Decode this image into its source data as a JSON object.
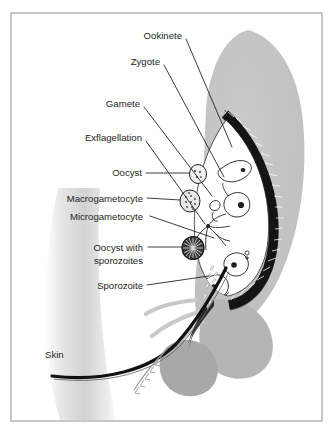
{
  "figure": {
    "type": "diagram",
    "border_color": "#9a9a9a",
    "background_color": "#ffffff"
  },
  "palette": {
    "abdomen_gray": "#c2c2c2",
    "shadow_gray": "#a8a8a8",
    "gut_wall_dark": "#1a1a1a",
    "lumen_white": "#ffffff",
    "skin_gray": "#d8d8d8",
    "text_black": "#231f20",
    "leader_black": "#1a1a1a"
  },
  "labels": [
    {
      "id": "ookinete",
      "text": "Ookinete",
      "x": 182,
      "y": 36,
      "anchor": "end",
      "leader": "M 186 39 L 232 147"
    },
    {
      "id": "zygote",
      "text": "Zygote",
      "x": 160,
      "y": 62,
      "anchor": "end",
      "leader": "M 164 65 L 224 177"
    },
    {
      "id": "gamete",
      "text": "Gamete",
      "x": 140,
      "y": 104,
      "anchor": "end",
      "leader": "M 144 107 L 212 196"
    },
    {
      "id": "exflagellation",
      "text": "Exflagellation",
      "x": 142,
      "y": 138,
      "anchor": "end",
      "leader": "M 146 141 L 205 224"
    },
    {
      "id": "oocyst",
      "text": "Oocyst",
      "x": 142,
      "y": 172,
      "anchor": "end",
      "leader": "M 146 174 L 195 175"
    },
    {
      "id": "macrogametocyte",
      "text": "Macrogametocyte",
      "x": 143,
      "y": 200,
      "anchor": "end",
      "leader": "M 147 199 L 190 200"
    },
    {
      "id": "microgametocyte",
      "text": "Microgametocyte",
      "x": 143,
      "y": 219,
      "anchor": "end",
      "leader": "M 150 217 L 215 236"
    },
    {
      "id": "oocyst-with-sporozoites-line1",
      "text": "Oocyst with",
      "x": 143,
      "y": 251,
      "anchor": "end",
      "leader": "M 148 248 L 193 248"
    },
    {
      "id": "oocyst-with-sporozoites-line2",
      "text": "sporozoites",
      "x": 143,
      "y": 264,
      "anchor": "end",
      "leader": ""
    },
    {
      "id": "sporozoite",
      "text": "Sporozoite",
      "x": 143,
      "y": 288,
      "anchor": "end",
      "leader": "M 147 286 L 207 277"
    },
    {
      "id": "skin",
      "text": "Skin",
      "x": 45,
      "y": 358,
      "anchor": "start",
      "leader": ""
    }
  ],
  "structures": [
    {
      "id": "mosquito-abdomen",
      "name": "mosquito abdomen"
    },
    {
      "id": "midgut-wall",
      "name": "striated midgut wall"
    },
    {
      "id": "midgut-lumen",
      "name": "midgut lumen"
    },
    {
      "id": "oocyst-small",
      "name": "small oocyst on gut wall"
    },
    {
      "id": "macrogametocyte-cell",
      "name": "macrogametocyte"
    },
    {
      "id": "mature-oocyst",
      "name": "oocyst with sporozoites"
    },
    {
      "id": "ookinete-cell",
      "name": "ookinete"
    },
    {
      "id": "zygote-cell",
      "name": "zygote"
    },
    {
      "id": "gamete-cells",
      "name": "gametes"
    },
    {
      "id": "exflagellation-cell",
      "name": "exflagellating microgametocyte"
    },
    {
      "id": "sporozoite-trail",
      "name": "sporozoite trail"
    },
    {
      "id": "proboscis",
      "name": "proboscis"
    },
    {
      "id": "mosquito-legs",
      "name": "mosquito legs"
    },
    {
      "id": "salivary-gland",
      "name": "salivary gland"
    },
    {
      "id": "human-skin",
      "name": "human skin surface"
    }
  ]
}
